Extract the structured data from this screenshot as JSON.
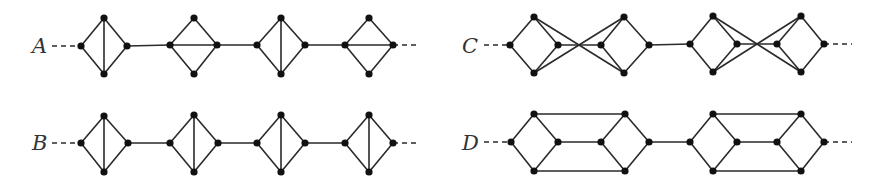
{
  "figure": {
    "colors": {
      "edge": "#2a2a2a",
      "vertex": "#111111",
      "label": "#333333"
    },
    "vertex_radius": 3.6,
    "graphs": [
      {
        "label": "A",
        "label_pos": [
          32,
          53
        ],
        "dash_left": [
          52,
          46,
          81,
          46
        ],
        "dash_right": [
          393,
          45,
          420,
          45
        ],
        "diamonds": [
          {
            "l": [
              81,
              46
            ],
            "t": [
              104,
              18
            ],
            "r": [
              127,
              46
            ],
            "b": [
              104,
              74
            ],
            "diag": "vertical"
          },
          {
            "l": [
              170,
              45
            ],
            "t": [
              194,
              18
            ],
            "r": [
              217,
              45
            ],
            "b": [
              194,
              74
            ],
            "diag": "horizontal"
          },
          {
            "l": [
              257,
              45
            ],
            "t": [
              281,
              18
            ],
            "r": [
              305,
              45
            ],
            "b": [
              281,
              74
            ],
            "diag": "vertical"
          },
          {
            "l": [
              345,
              45
            ],
            "t": [
              369,
              18
            ],
            "r": [
              393,
              45
            ],
            "b": [
              369,
              74
            ],
            "diag": "horizontal"
          }
        ],
        "links": [
          [
            127,
            46,
            170,
            45
          ],
          [
            217,
            45,
            257,
            45
          ],
          [
            305,
            45,
            345,
            45
          ]
        ]
      },
      {
        "label": "B",
        "label_pos": [
          32,
          150
        ],
        "dash_left": [
          52,
          143,
          81,
          143
        ],
        "dash_right": [
          393,
          143,
          420,
          143
        ],
        "diamonds": [
          {
            "l": [
              81,
              143
            ],
            "t": [
              104,
              116
            ],
            "r": [
              128,
              143
            ],
            "b": [
              104,
              172
            ],
            "diag": "vertical"
          },
          {
            "l": [
              170,
              143
            ],
            "t": [
              194,
              115
            ],
            "r": [
              218,
              143
            ],
            "b": [
              194,
              172
            ],
            "diag": "vertical"
          },
          {
            "l": [
              257,
              143
            ],
            "t": [
              281,
              115
            ],
            "r": [
              305,
              143
            ],
            "b": [
              281,
              172
            ],
            "diag": "vertical"
          },
          {
            "l": [
              345,
              143
            ],
            "t": [
              369,
              115
            ],
            "r": [
              393,
              143
            ],
            "b": [
              369,
              172
            ],
            "diag": "vertical"
          }
        ],
        "links": [
          [
            128,
            143,
            170,
            143
          ],
          [
            218,
            143,
            257,
            143
          ],
          [
            305,
            143,
            345,
            143
          ]
        ]
      },
      {
        "label": "C",
        "label_pos": [
          462,
          53
        ],
        "dash_left": [
          484,
          45,
          510,
          45
        ],
        "dash_right": [
          824,
          44,
          852,
          44
        ],
        "diamonds": [
          {
            "l": [
              510,
              45
            ],
            "t": [
              534,
              17
            ],
            "r": [
              558,
              45
            ],
            "b": [
              534,
              73
            ],
            "diag": "none"
          },
          {
            "l": [
              601,
              45
            ],
            "t": [
              624,
              17
            ],
            "r": [
              649,
              45
            ],
            "b": [
              624,
              73
            ],
            "diag": "none"
          },
          {
            "l": [
              690,
              44
            ],
            "t": [
              713,
              16
            ],
            "r": [
              737,
              44
            ],
            "b": [
              713,
              72
            ],
            "diag": "none"
          },
          {
            "l": [
              777,
              44
            ],
            "t": [
              801,
              16
            ],
            "r": [
              824,
              44
            ],
            "b": [
              801,
              72
            ],
            "diag": "none"
          }
        ],
        "links": [
          [
            558,
            45,
            601,
            45
          ],
          [
            534,
            17,
            624,
            73
          ],
          [
            534,
            73,
            624,
            17
          ],
          [
            649,
            45,
            690,
            44
          ],
          [
            737,
            44,
            777,
            44
          ],
          [
            713,
            16,
            801,
            72
          ],
          [
            713,
            72,
            801,
            16
          ]
        ]
      },
      {
        "label": "D",
        "label_pos": [
          462,
          150
        ],
        "dash_left": [
          484,
          142,
          511,
          142
        ],
        "dash_right": [
          824,
          142,
          852,
          142
        ],
        "diamonds": [
          {
            "l": [
              511,
              142
            ],
            "t": [
              534,
              114
            ],
            "r": [
              558,
              142
            ],
            "b": [
              534,
              171
            ],
            "diag": "none"
          },
          {
            "l": [
              601,
              142
            ],
            "t": [
              625,
              114
            ],
            "r": [
              649,
              142
            ],
            "b": [
              625,
              171
            ],
            "diag": "none"
          },
          {
            "l": [
              690,
              142
            ],
            "t": [
              713,
              114
            ],
            "r": [
              737,
              142
            ],
            "b": [
              713,
              171
            ],
            "diag": "none"
          },
          {
            "l": [
              777,
              142
            ],
            "t": [
              801,
              114
            ],
            "r": [
              824,
              142
            ],
            "b": [
              801,
              171
            ],
            "diag": "none"
          }
        ],
        "links": [
          [
            558,
            142,
            601,
            142
          ],
          [
            534,
            114,
            625,
            114
          ],
          [
            534,
            171,
            625,
            171
          ],
          [
            649,
            142,
            690,
            142
          ],
          [
            737,
            142,
            777,
            142
          ],
          [
            713,
            114,
            801,
            114
          ],
          [
            713,
            171,
            801,
            171
          ]
        ]
      }
    ]
  }
}
